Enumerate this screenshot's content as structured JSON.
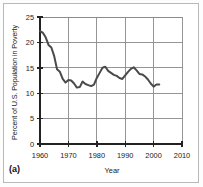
{
  "figure": {
    "caption": "(a)",
    "background_color": "#ffffff",
    "border_color": "#b9b9b9"
  },
  "chart_data": {
    "type": "line",
    "title": "",
    "xlabel": "Year",
    "ylabel": "Percent of U.S. Population in Poverty",
    "xlim": [
      1960,
      2010
    ],
    "ylim": [
      0,
      25
    ],
    "xticks": [
      1960,
      1970,
      1980,
      1990,
      2000,
      2010
    ],
    "xtick_labels": [
      "1960",
      "1970",
      "1980",
      "1990",
      "2000",
      "2010"
    ],
    "yticks": [
      0,
      5,
      10,
      15,
      20,
      25
    ],
    "ytick_labels": [
      "0",
      "5",
      "10",
      "15",
      "20",
      "25"
    ],
    "grid": true,
    "grid_color": "#8a8a8a",
    "axis_color": "#222222",
    "line_color": "#4a4a4a",
    "line_width": 2.0,
    "legend": null,
    "series": [
      {
        "name": "Percent of U.S. Population in Poverty",
        "x": [
          1960,
          1961,
          1962,
          1963,
          1964,
          1965,
          1966,
          1967,
          1968,
          1969,
          1970,
          1971,
          1972,
          1973,
          1974,
          1975,
          1976,
          1977,
          1978,
          1979,
          1980,
          1981,
          1982,
          1983,
          1984,
          1985,
          1986,
          1987,
          1988,
          1989,
          1990,
          1991,
          1992,
          1993,
          1994,
          1995,
          1996,
          1997,
          1998,
          1999,
          2000,
          2001,
          2002
        ],
        "values": [
          22.2,
          21.9,
          21.0,
          19.5,
          19.0,
          17.3,
          14.7,
          14.2,
          12.8,
          12.1,
          12.6,
          12.5,
          11.9,
          11.1,
          11.2,
          12.3,
          11.8,
          11.6,
          11.4,
          11.7,
          13.0,
          14.0,
          15.0,
          15.2,
          14.4,
          14.0,
          13.6,
          13.4,
          13.0,
          12.8,
          13.5,
          14.2,
          14.8,
          15.1,
          14.5,
          13.8,
          13.7,
          13.3,
          12.7,
          11.9,
          11.3,
          11.7,
          11.7
        ]
      }
    ]
  }
}
